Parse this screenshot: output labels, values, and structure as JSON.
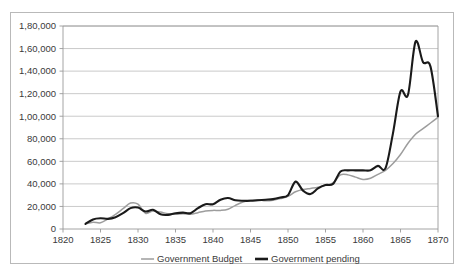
{
  "chart_data": {
    "type": "line",
    "title": "",
    "xlabel": "",
    "ylabel": "",
    "xlim": [
      1820,
      1870
    ],
    "ylim": [
      0,
      180000
    ],
    "grid": true,
    "legend_position": "bottom",
    "x_tick_labels": [
      "1820",
      "1825",
      "1830",
      "1835",
      "1840",
      "1845",
      "1850",
      "1855",
      "1860",
      "1865",
      "1870"
    ],
    "x_ticks": [
      1820,
      1825,
      1830,
      1835,
      1840,
      1845,
      1850,
      1855,
      1860,
      1865,
      1870
    ],
    "y_tick_labels": [
      "0",
      "20,000",
      "40,000",
      "60,000",
      "80,000",
      "1,00,000",
      "1,20,000",
      "1,40,000",
      "1,60,000",
      "1,80,000"
    ],
    "y_ticks": [
      0,
      20000,
      40000,
      60000,
      80000,
      100000,
      120000,
      140000,
      160000,
      180000
    ],
    "x": [
      1823,
      1824,
      1825,
      1826,
      1827,
      1828,
      1829,
      1830,
      1831,
      1832,
      1833,
      1834,
      1835,
      1836,
      1837,
      1838,
      1839,
      1840,
      1841,
      1842,
      1843,
      1844,
      1845,
      1846,
      1847,
      1848,
      1849,
      1850,
      1851,
      1852,
      1853,
      1854,
      1855,
      1856,
      1857,
      1858,
      1859,
      1860,
      1861,
      1862,
      1863,
      1864,
      1865,
      1866,
      1867,
      1868,
      1869,
      1870
    ],
    "series": [
      {
        "name": "Government Budget",
        "color": "#9d9d9d",
        "width": 1.5,
        "values": [
          4500,
          6000,
          5500,
          9000,
          13000,
          18000,
          23000,
          22000,
          14000,
          16000,
          15000,
          13500,
          13000,
          13500,
          13000,
          14500,
          16000,
          16500,
          16500,
          17500,
          21000,
          24000,
          25500,
          26000,
          25000,
          25500,
          27000,
          29000,
          33000,
          35000,
          36000,
          37000,
          39000,
          41000,
          48000,
          48000,
          46000,
          44000,
          45000,
          48500,
          52000,
          58000,
          66000,
          76000,
          84000,
          89000,
          94000,
          99000
        ]
      },
      {
        "name": "Government pending",
        "color": "#1a1a1a",
        "width": 2.1,
        "values": [
          4500,
          8500,
          9500,
          9000,
          10500,
          14000,
          18500,
          19000,
          15500,
          17000,
          13000,
          12500,
          14000,
          14500,
          14000,
          18500,
          22000,
          22000,
          26000,
          27500,
          25500,
          25000,
          25000,
          25500,
          26000,
          26500,
          28000,
          30000,
          42000,
          34000,
          31000,
          36000,
          39000,
          40000,
          51000,
          52000,
          52000,
          52000,
          52000,
          56000,
          54000,
          85000,
          122000,
          119000,
          166000,
          148000,
          144000,
          100000
        ]
      }
    ],
    "legend": [
      {
        "label": "Government Budget",
        "color": "#9d9d9d",
        "width": 1.5
      },
      {
        "label": "Government pending",
        "color": "#1a1a1a",
        "width": 2.6
      }
    ]
  }
}
